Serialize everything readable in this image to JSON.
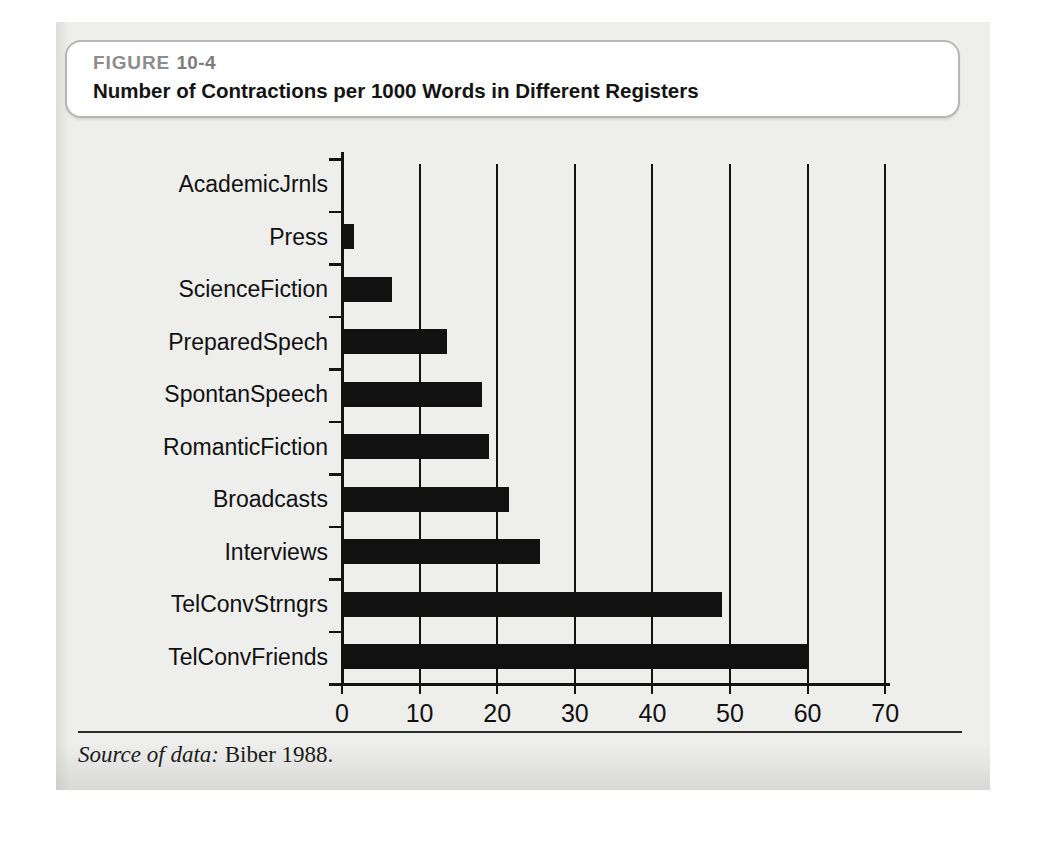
{
  "figure": {
    "label_word": "FIGURE",
    "number": "10-4",
    "caption": "Number of Contractions per 1000 Words in Different Registers",
    "source_lead": "Source of data:",
    "source_text": "Biber 1988."
  },
  "colors": {
    "panel_background": "#eeeeec",
    "caption_box_background": "#ffffff",
    "caption_box_border": "#b6b6b6",
    "figure_label_text": "#8c8c8c",
    "caption_text": "#141414",
    "bar_fill": "#111111",
    "axis_line": "#131313",
    "gridline": "#131313"
  },
  "chart_data": {
    "type": "bar",
    "orientation": "horizontal",
    "title": "Number of Contractions per 1000 Words in Different Registers",
    "xlabel": "",
    "ylabel": "",
    "xlim": [
      0,
      70
    ],
    "ylim": null,
    "grid": true,
    "grid_axis": "x",
    "legend": false,
    "legend_position": "none",
    "xticks": [
      0,
      10,
      20,
      30,
      40,
      50,
      60,
      70
    ],
    "xtick_labels": [
      "0",
      "10",
      "20",
      "30",
      "40",
      "50",
      "60",
      "70"
    ],
    "categories": [
      "AcademicJrnls",
      "Press",
      "ScienceFiction",
      "PreparedSpech",
      "SpontanSpeech",
      "RomanticFiction",
      "Broadcasts",
      "Interviews",
      "TelConvStrngrs",
      "TelConvFriends"
    ],
    "values": [
      0.3,
      1.5,
      6.5,
      13.5,
      18,
      19,
      21.5,
      25.5,
      49,
      60
    ],
    "annotations": [
      "Source of data: Biber 1988."
    ]
  }
}
